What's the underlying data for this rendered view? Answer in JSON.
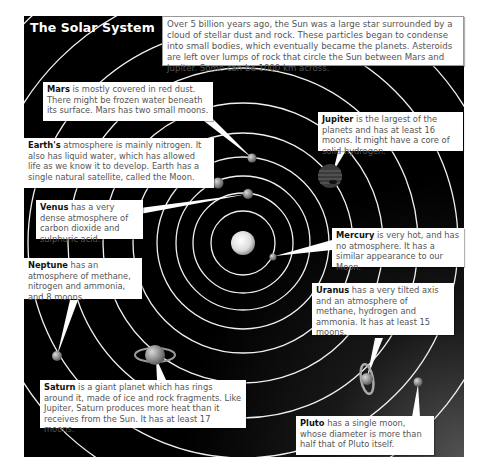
{
  "title": "The Solar System",
  "intro": "Over 5 billion years ago, the Sun was a large star surrounded by a cloud of stellar dust and rock. These particles began to condense into small bodies, which eventually became the planets. Asteroids are left over lumps of rock that circle the Sun between Mars and Jupiter. Some can be 1000 km across.",
  "colors": {
    "background": "#000000",
    "orbit": "#ffffff",
    "callout_bg": "#ffffff",
    "text": "#555555"
  },
  "planets": [
    {
      "name": "Mars",
      "desc": " is mostly covered in red dust. There might be frozen water beneath its surface. Mars has two small moons."
    },
    {
      "name": "Earth's",
      "desc": " atmosphere is mainly nitrogen. It also has liquid water, which has allowed life as we know it to develop. Earth has a single natural satellite, called the Moon."
    },
    {
      "name": "Jupiter",
      "desc": " is the largest of the planets and has at least 16 moons. It might have a core of solid hydrogen."
    },
    {
      "name": "Venus",
      "desc": " has a very dense atmosphere of carbon dioxide and sulphuric acid."
    },
    {
      "name": "Mercury",
      "desc": " is very hot, and has no atmosphere. It has a similar appearance to our Moon."
    },
    {
      "name": "Neptune",
      "desc": " has an atmosphere of methane, nitrogen and ammonia, and 8 moons."
    },
    {
      "name": "Uranus",
      "desc": " has a very tilted axis and an atmosphere of methane, hydrogen and ammonia. It has at least 15 moons."
    },
    {
      "name": "Saturn",
      "desc": " is a giant planet which has rings around it, made of ice and rock fragments. Like Jupiter, Saturn produces more heat than it receives from the Sun. It has at least 17 moons."
    },
    {
      "name": "Pluto",
      "desc": " has a single moon, whose diameter is more than half that of Pluto itself."
    }
  ]
}
